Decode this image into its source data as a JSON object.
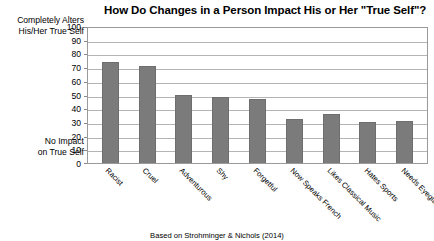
{
  "chart_data": {
    "type": "bar",
    "title": "How Do Changes in a Person Impact His or Her \"True Self\"?",
    "xlabel": "",
    "ylabel": "",
    "ylim": [
      0,
      100
    ],
    "yticks": [
      100,
      90,
      80,
      70,
      60,
      50,
      40,
      30,
      20,
      10,
      0
    ],
    "grid": true,
    "legend": null,
    "categories": [
      "Racist",
      "Cruel",
      "Adventurous",
      "Shy",
      "Forgetful",
      "Now Speaks French",
      "Likes Classical Music",
      "Hates Sports",
      "Needs Eyeglasses"
    ],
    "values": [
      74,
      71,
      50,
      48,
      47,
      32,
      36,
      30,
      31
    ],
    "annotations": {
      "y_axis_top": "Completely Alters\nHis/Her True Self",
      "y_axis_top_line1": "Completely Alters",
      "y_axis_top_line2": "His/Her True Self",
      "y_axis_bottom_line1": "No Impact",
      "y_axis_bottom_line2": "on True Self"
    },
    "source": "Based on Strohminger & Nichols (2014)",
    "colors": {
      "bar": "#7b7b7b",
      "bar_border": "#6e6e6e",
      "gridline": "#b4b4b4",
      "axis": "#9a9a9a",
      "text": "#000000",
      "background": "#ffffff"
    }
  }
}
